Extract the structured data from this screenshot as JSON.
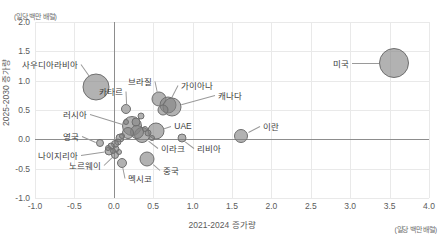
{
  "chart_data": {
    "type": "scatter",
    "title": "",
    "xlabel": "2021-2024 증가량",
    "ylabel": "2025-2030 증가량",
    "unit_note_y": "(일당 백만 배럴)",
    "unit_note_x": "(일당 백만 배럴)",
    "xlim": [
      -1.0,
      4.0
    ],
    "ylim": [
      -1.0,
      2.0
    ],
    "xticks": [
      "-1.0",
      "-0.5",
      "0.0",
      "0.5",
      "1.0",
      "1.5",
      "2.0",
      "2.5",
      "3.0",
      "3.5",
      "4.0"
    ],
    "yticks": [
      "2.0",
      "1.5",
      "1.0",
      "0.5",
      "0.0",
      "-0.5",
      "-1.0"
    ],
    "grid": true,
    "legend": "none",
    "bubble_color": "#828282",
    "bubble_border": "#6f6f6f",
    "points": [
      {
        "label": "미국",
        "x": 3.55,
        "y": 1.3,
        "size": 30,
        "label_side": "l",
        "lx": 3.02,
        "ly": 1.3
      },
      {
        "label": "사우디아라비아",
        "x": -0.22,
        "y": 0.9,
        "size": 27,
        "label_side": "l",
        "lx": -0.42,
        "ly": 1.28
      },
      {
        "label": "브라질",
        "x": 0.57,
        "y": 0.68,
        "size": 15,
        "label_side": "l",
        "lx": 0.52,
        "ly": 1.0
      },
      {
        "label": "가이아나",
        "x": 0.69,
        "y": 0.58,
        "size": 17,
        "label_side": "r",
        "lx": 0.82,
        "ly": 0.92
      },
      {
        "label": "캐나다",
        "x": 0.74,
        "y": 0.55,
        "size": 19,
        "label_side": "r",
        "lx": 1.28,
        "ly": 0.75
      },
      {
        "label": "카타르",
        "x": 0.16,
        "y": 0.52,
        "size": 10,
        "label_side": "l",
        "lx": 0.15,
        "ly": 0.82
      },
      {
        "label": "러시아",
        "x": 0.23,
        "y": 0.22,
        "size": 20,
        "label_side": "l",
        "lx": -0.3,
        "ly": 0.44
      },
      {
        "label": "UAE",
        "x": 0.53,
        "y": 0.14,
        "size": 17,
        "label_side": "r",
        "lx": 0.73,
        "ly": 0.23
      },
      {
        "label": "이란",
        "x": 1.62,
        "y": 0.06,
        "size": 14,
        "label_side": "r",
        "lx": 1.85,
        "ly": 0.22
      },
      {
        "label": "이라크",
        "x": 0.36,
        "y": 0.07,
        "size": 16,
        "label_side": "r",
        "lx": 0.56,
        "ly": -0.14
      },
      {
        "label": "리비아",
        "x": 0.86,
        "y": 0.02,
        "size": 9,
        "label_side": "r",
        "lx": 1.02,
        "ly": -0.14
      },
      {
        "label": "영국",
        "x": -0.18,
        "y": -0.07,
        "size": 8,
        "label_side": "l",
        "lx": -0.4,
        "ly": 0.06
      },
      {
        "label": "나이지리아",
        "x": -0.06,
        "y": -0.2,
        "size": 9,
        "label_side": "l",
        "lx": -0.42,
        "ly": -0.27
      },
      {
        "label": "노르웨이",
        "x": 0.02,
        "y": -0.26,
        "size": 8,
        "label_side": "l",
        "lx": -0.12,
        "ly": -0.44
      },
      {
        "label": "멕시코",
        "x": 0.1,
        "y": -0.4,
        "size": 10,
        "label_side": "r",
        "lx": 0.14,
        "ly": -0.66
      },
      {
        "label": "중국",
        "x": 0.42,
        "y": -0.33,
        "size": 15,
        "label_side": "r",
        "lx": 0.58,
        "ly": -0.52
      },
      {
        "label": "",
        "x": 0.28,
        "y": 0.3,
        "size": 9,
        "label_side": "r",
        "lx": 0.28,
        "ly": 0.3
      },
      {
        "label": "",
        "x": 0.3,
        "y": 0.12,
        "size": 14,
        "label_side": "r",
        "lx": 0.3,
        "ly": 0.12
      },
      {
        "label": "",
        "x": 0.18,
        "y": 0.1,
        "size": 12,
        "label_side": "r",
        "lx": 0.18,
        "ly": 0.1
      },
      {
        "label": "",
        "x": 0.08,
        "y": 0.02,
        "size": 9,
        "label_side": "r",
        "lx": 0.08,
        "ly": 0.02
      },
      {
        "label": "",
        "x": 0.05,
        "y": -0.04,
        "size": 7,
        "label_side": "r",
        "lx": 0.05,
        "ly": -0.04
      },
      {
        "label": "",
        "x": 0.01,
        "y": -0.08,
        "size": 8,
        "label_side": "r",
        "lx": 0.01,
        "ly": -0.08
      },
      {
        "label": "",
        "x": -0.03,
        "y": -0.12,
        "size": 7,
        "label_side": "r",
        "lx": -0.03,
        "ly": -0.12
      },
      {
        "label": "",
        "x": -0.07,
        "y": -0.14,
        "size": 6,
        "label_side": "r",
        "lx": -0.07,
        "ly": -0.14
      },
      {
        "label": "",
        "x": 0.03,
        "y": -0.16,
        "size": 7,
        "label_side": "r",
        "lx": 0.03,
        "ly": -0.16
      },
      {
        "label": "",
        "x": -0.01,
        "y": -0.2,
        "size": 6,
        "label_side": "r",
        "lx": -0.01,
        "ly": -0.2
      },
      {
        "label": "",
        "x": 0.06,
        "y": -0.22,
        "size": 6,
        "label_side": "r",
        "lx": 0.06,
        "ly": -0.22
      },
      {
        "label": "",
        "x": 0.11,
        "y": 0.05,
        "size": 6,
        "label_side": "r",
        "lx": 0.11,
        "ly": 0.05
      },
      {
        "label": "",
        "x": 0.44,
        "y": 0.1,
        "size": 7,
        "label_side": "r",
        "lx": 0.44,
        "ly": 0.1
      },
      {
        "label": "",
        "x": 0.48,
        "y": 0.03,
        "size": 6,
        "label_side": "r",
        "lx": 0.48,
        "ly": 0.03
      },
      {
        "label": "",
        "x": 0.4,
        "y": 0.18,
        "size": 6,
        "label_side": "r",
        "lx": 0.4,
        "ly": 0.18
      },
      {
        "label": "",
        "x": 0.34,
        "y": 0.4,
        "size": 7,
        "label_side": "r",
        "lx": 0.34,
        "ly": 0.4
      },
      {
        "label": "",
        "x": 0.15,
        "y": 0.3,
        "size": 6,
        "label_side": "r",
        "lx": 0.15,
        "ly": 0.3
      },
      {
        "label": "",
        "x": 0.62,
        "y": 0.5,
        "size": 11,
        "label_side": "r",
        "lx": 0.62,
        "ly": 0.5
      }
    ]
  }
}
